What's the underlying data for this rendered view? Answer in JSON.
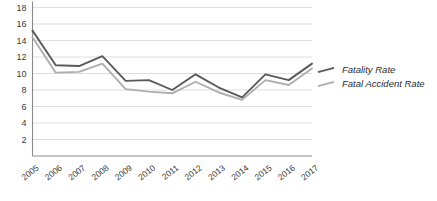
{
  "chart_data": {
    "type": "line",
    "title": "",
    "xlabel": "",
    "ylabel": "",
    "categories": [
      "2005",
      "2006",
      "2007",
      "2008",
      "2009",
      "2010",
      "2011",
      "2012",
      "2013",
      "2014",
      "2015",
      "2016",
      "2017"
    ],
    "ylim": [
      0,
      18
    ],
    "yticks": [
      2,
      4,
      6,
      8,
      10,
      12,
      14,
      16,
      18
    ],
    "grid": true,
    "legend_position": "right",
    "series": [
      {
        "name": "Fatality Rate",
        "color": "#5a5a5a",
        "values": [
          15.2,
          11.0,
          10.9,
          12.1,
          9.1,
          9.2,
          8.0,
          9.9,
          8.3,
          7.1,
          9.9,
          9.2,
          11.2
        ]
      },
      {
        "name": "Fatal Accident Rate",
        "color": "#aeaeae",
        "values": [
          14.4,
          10.1,
          10.2,
          11.2,
          8.1,
          7.8,
          7.6,
          9.0,
          7.7,
          6.8,
          9.2,
          8.6,
          10.6
        ]
      }
    ]
  },
  "axis": {
    "y_labels": [
      "18",
      "16",
      "14",
      "12",
      "10",
      "8",
      "6",
      "4",
      "2"
    ],
    "x_labels": [
      "2005",
      "2006",
      "2007",
      "2008",
      "2009",
      "2010",
      "2011",
      "2012",
      "2013",
      "2014",
      "2015",
      "2016",
      "2017"
    ]
  },
  "legend": {
    "entries": [
      {
        "label": "Fatality Rate",
        "color": "#5a5a5a"
      },
      {
        "label": "Fatal Accident Rate",
        "color": "#aeaeae"
      }
    ]
  },
  "colors": {
    "fatality_rate": "#5a5a5a",
    "fatal_accident_rate": "#aeaeae",
    "grid": "#d6d6d6",
    "axis": "#8a8a8a",
    "text": "#3a3a3a",
    "background": "#ffffff"
  }
}
